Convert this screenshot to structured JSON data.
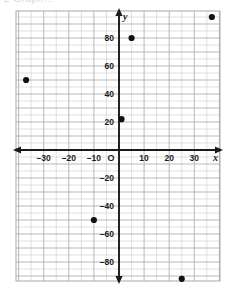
{
  "caption": {
    "text": "2  Graph..."
  },
  "chart_data": {
    "type": "scatter",
    "title": "",
    "xlabel": "x",
    "ylabel": "y",
    "xlim": [
      -41,
      41
    ],
    "ylim": [
      -99,
      99
    ],
    "grid": true,
    "grid_step_minor": 5,
    "grid_step_major": 10,
    "legend": "none",
    "origin_label": "O",
    "xticks": [
      -30,
      -20,
      -10,
      10,
      20,
      30
    ],
    "xtick_labels": [
      "–30",
      "–20",
      "–10",
      "10",
      "20",
      "30"
    ],
    "yticks": [
      80,
      60,
      40,
      20,
      -20,
      -40,
      -60,
      -80
    ],
    "ytick_labels": [
      "80",
      "60",
      "40",
      "20",
      "–20",
      "–40",
      "–60",
      "–80"
    ],
    "points": [
      {
        "x": 37,
        "y": 95
      },
      {
        "x": 5,
        "y": 80
      },
      {
        "x": -37,
        "y": 50
      },
      {
        "x": 1,
        "y": 22
      },
      {
        "x": -10,
        "y": -50
      },
      {
        "x": 25,
        "y": -92
      }
    ],
    "point_color": "#111111",
    "axis_color": "#1a1a1a",
    "grid_color": "#d2d2d2"
  }
}
